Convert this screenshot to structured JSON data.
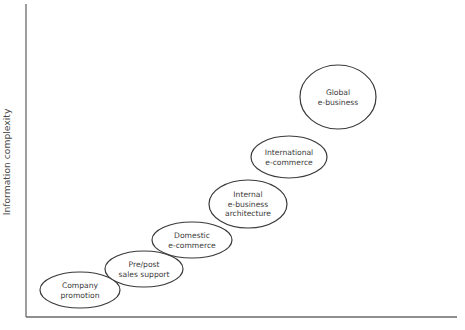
{
  "diagram": {
    "type": "staircase-of-ellipses",
    "y_axis_label": "Information complexity",
    "x_axis_label": "",
    "stages": [
      {
        "id": "company-promotion",
        "lines": [
          "Company",
          "promotion"
        ],
        "cx": 80,
        "cy": 290,
        "rx": 40,
        "ry": 18
      },
      {
        "id": "pre-post-sales-support",
        "lines": [
          "Pre/post",
          "sales support"
        ],
        "cx": 144,
        "cy": 269,
        "rx": 39,
        "ry": 18
      },
      {
        "id": "domestic-e-commerce",
        "lines": [
          "Domestic",
          "e-commerce"
        ],
        "cx": 192,
        "cy": 240,
        "rx": 40,
        "ry": 18
      },
      {
        "id": "internal-e-business-architecture",
        "lines": [
          "Internal",
          "e-business",
          "architecture"
        ],
        "cx": 248,
        "cy": 204,
        "rx": 39,
        "ry": 24
      },
      {
        "id": "international-e-commerce",
        "lines": [
          "International",
          "e-commerce"
        ],
        "cx": 289,
        "cy": 157,
        "rx": 38,
        "ry": 21
      },
      {
        "id": "global-e-business",
        "lines": [
          "Global",
          "e-business"
        ],
        "cx": 338,
        "cy": 97,
        "rx": 38,
        "ry": 32
      }
    ],
    "colors": {
      "background": "#ffffff",
      "outline": "#3a3a3a",
      "axis": "#6a6a6a",
      "text": "#3a3a3a"
    }
  }
}
